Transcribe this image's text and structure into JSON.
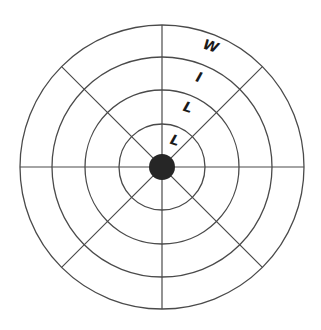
{
  "diagram": {
    "type": "concentric-wheel",
    "center": [
      162,
      167
    ],
    "hub_radius": 13,
    "ring_radii": [
      43,
      77,
      110,
      142
    ],
    "spoke_count": 8,
    "colors": {
      "line": "#4a4a4a",
      "hub": "#262626",
      "text": "#1a1a1a"
    },
    "labels": [
      {
        "text": "L",
        "x": 175,
        "y": 140
      },
      {
        "text": "L",
        "x": 188,
        "y": 107
      },
      {
        "text": "I",
        "x": 199,
        "y": 77
      },
      {
        "text": "W",
        "x": 211,
        "y": 46
      }
    ]
  }
}
